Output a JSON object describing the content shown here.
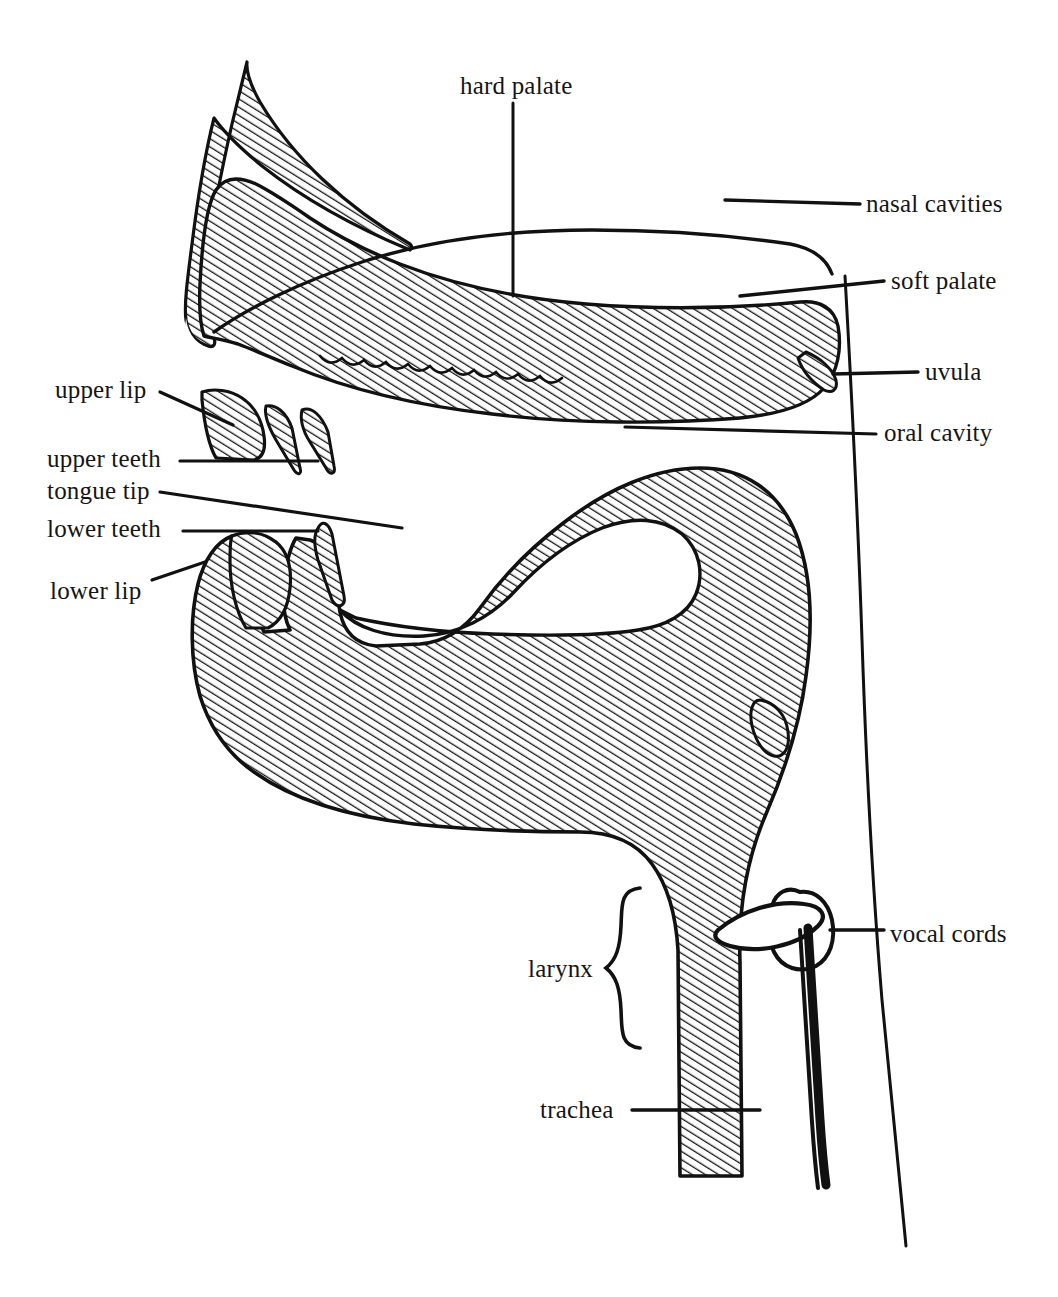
{
  "figure": {
    "kind": "anatomical-diagram",
    "style": "black line drawing with diagonal hatching on tissue, white cavities",
    "background_color": "#ffffff",
    "ink_color": "#111111",
    "hatch_color": "#1a1a1a"
  },
  "labels": {
    "hard_palate": "hard palate",
    "nasal_cavities": "nasal cavities",
    "soft_palate": "soft palate",
    "uvula": "uvula",
    "oral_cavity": "oral cavity",
    "upper_lip": "upper lip",
    "upper_teeth": "upper teeth",
    "tongue_tip": "tongue tip",
    "lower_teeth": "lower teeth",
    "lower_lip": "lower lip",
    "vocal_cords": "vocal cords",
    "larynx": "larynx",
    "trachea": "trachea"
  },
  "callouts": [
    {
      "id": "hard-palate",
      "text": "hard palate",
      "side": "top",
      "text_x": 460,
      "text_y": 92,
      "leader": "vertical line down to the palate arch"
    },
    {
      "id": "nasal-cavities",
      "text": "nasal cavities",
      "side": "right",
      "text_x": 866,
      "text_y": 210,
      "leader": "horizontal line left into the nasal passage"
    },
    {
      "id": "soft-palate",
      "text": "soft palate",
      "side": "right",
      "text_x": 891,
      "text_y": 288,
      "leader": "horizontal line left onto the velum"
    },
    {
      "id": "uvula",
      "text": "uvula",
      "side": "right",
      "text_x": 925,
      "text_y": 378,
      "leader": "horizontal line left to the uvula tip"
    },
    {
      "id": "oral-cavity",
      "text": "oral cavity",
      "side": "right",
      "text_x": 884,
      "text_y": 438,
      "leader": "horizontal line left into the mouth cavity"
    },
    {
      "id": "upper-lip",
      "text": "upper lip",
      "side": "left",
      "text_x": 55,
      "text_y": 396,
      "leader": "short diagonal line down-right to the upper lip"
    },
    {
      "id": "upper-teeth",
      "text": "upper teeth",
      "side": "left",
      "text_x": 47,
      "text_y": 466,
      "leader": "horizontal line right to the upper incisor"
    },
    {
      "id": "tongue-tip",
      "text": "tongue tip",
      "side": "left",
      "text_x": 47,
      "text_y": 498,
      "leader": "long shallow diagonal line right to the tongue tip"
    },
    {
      "id": "lower-teeth",
      "text": "lower teeth",
      "side": "left",
      "text_x": 47,
      "text_y": 536,
      "leader": "horizontal line right to the lower incisor"
    },
    {
      "id": "lower-lip",
      "text": "lower lip",
      "side": "left",
      "text_x": 50,
      "text_y": 598,
      "leader": "short diagonal line up-right to the lower lip"
    },
    {
      "id": "vocal-cords",
      "text": "vocal cords",
      "side": "right",
      "text_x": 890,
      "text_y": 940,
      "leader": "horizontal line left to the glottis"
    },
    {
      "id": "larynx",
      "text": "larynx",
      "side": "left",
      "text_x": 528,
      "text_y": 975,
      "leader": "curly brace spanning the larynx region"
    },
    {
      "id": "trachea",
      "text": "trachea",
      "side": "left",
      "text_x": 540,
      "text_y": 1118,
      "leader": "horizontal line right across the tracheal wall"
    }
  ],
  "structures": [
    {
      "name": "nose-and-hard-palate-mass",
      "filled": "hatched"
    },
    {
      "name": "soft-palate-velum",
      "filled": "hatched"
    },
    {
      "name": "nasal-cavity",
      "filled": "white"
    },
    {
      "name": "oral-cavity",
      "filled": "white"
    },
    {
      "name": "upper-lip",
      "filled": "hatched"
    },
    {
      "name": "upper-teeth",
      "filled": "hatched"
    },
    {
      "name": "lower-lip",
      "filled": "hatched"
    },
    {
      "name": "lower-teeth",
      "filled": "hatched"
    },
    {
      "name": "tongue-and-jaw-mass",
      "filled": "hatched"
    },
    {
      "name": "epiglottis",
      "filled": "hatched"
    },
    {
      "name": "pharyngeal-back-wall",
      "filled": "outline"
    },
    {
      "name": "vocal-cords",
      "filled": "outline"
    },
    {
      "name": "larynx-cartilage",
      "filled": "outline"
    },
    {
      "name": "trachea-wall",
      "filled": "hatched"
    },
    {
      "name": "esophagus-line",
      "filled": "solid"
    }
  ]
}
